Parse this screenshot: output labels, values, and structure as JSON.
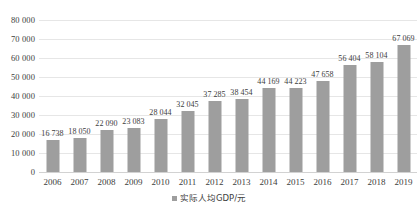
{
  "chart_data": {
    "type": "bar",
    "title": "",
    "subtitle": "",
    "xlabel": "",
    "ylabel": "",
    "ylim": [
      0,
      80000
    ],
    "ytick_step": 10000,
    "grid": true,
    "legend_position": "bottom-center",
    "categories": [
      "2006",
      "2007",
      "2008",
      "2009",
      "2010",
      "2011",
      "2012",
      "2013",
      "2014",
      "2015",
      "2016",
      "2017",
      "2018",
      "2019"
    ],
    "values": [
      16738,
      18050,
      22090,
      23083,
      28044,
      32045,
      37285,
      38454,
      44169,
      44223,
      47658,
      56404,
      58104,
      67069
    ],
    "data_labels": [
      "16 738",
      "18 050",
      "22 090",
      "23 083",
      "28 044",
      "32 045",
      "37 285",
      "38 454",
      "44 169",
      "44 223",
      "47 658",
      "56 404",
      "58 104",
      "67 069"
    ],
    "ytick_labels": [
      "0",
      "10 000",
      "20 000",
      "30 000",
      "40 000",
      "50 000",
      "60 000",
      "70 000",
      "80 000"
    ],
    "ytick_values": [
      0,
      10000,
      20000,
      30000,
      40000,
      50000,
      60000,
      70000,
      80000
    ],
    "series": [
      {
        "name": "实际人均GDP/元",
        "color": "#9e9e9e",
        "values": [
          16738,
          18050,
          22090,
          23083,
          28044,
          32045,
          37285,
          38454,
          44169,
          44223,
          47658,
          56404,
          58104,
          67069
        ]
      }
    ],
    "legend": [
      {
        "label": "实际人均GDP/元",
        "color": "#9e9e9e",
        "marker": "square"
      }
    ]
  },
  "colors": {
    "bar": "#9e9e9e",
    "gridline": "#e6e6e6",
    "baseline": "#d2d2d2",
    "text": "#3d3d3d",
    "background": "#ffffff"
  }
}
